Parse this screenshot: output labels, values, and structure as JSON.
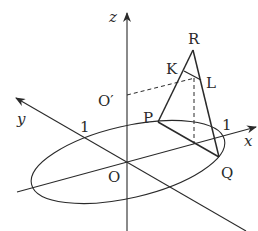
{
  "diagram": {
    "type": "3d-geometry",
    "axes": {
      "x_label": "x",
      "y_label": "y",
      "z_label": "z"
    },
    "ticks": {
      "x_tick": "1",
      "y_tick": "1"
    },
    "points": {
      "origin": "O",
      "o_prime": "O′",
      "P": "P",
      "Q": "Q",
      "R": "R",
      "K": "K",
      "L": "L"
    },
    "colors": {
      "stroke": "#2a2a2a",
      "background": "#ffffff"
    }
  }
}
